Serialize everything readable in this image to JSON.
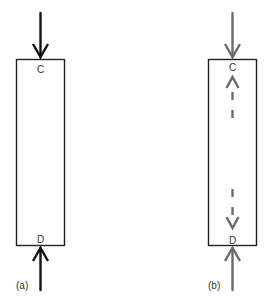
{
  "panels": [
    {
      "id": "a",
      "caption": "(a)",
      "top_label": "C",
      "bottom_label": "D",
      "arrow_color": "#111111",
      "internal_arrows": false
    },
    {
      "id": "b",
      "caption": "(b)",
      "top_label": "C",
      "bottom_label": "D",
      "arrow_color": "#6b6b6b",
      "internal_arrows": true
    }
  ],
  "colors": {
    "box_stroke": "#222222",
    "label_text": "#333333",
    "panel_b_arrow": "#6b6b6b",
    "panel_a_arrow": "#111111"
  }
}
